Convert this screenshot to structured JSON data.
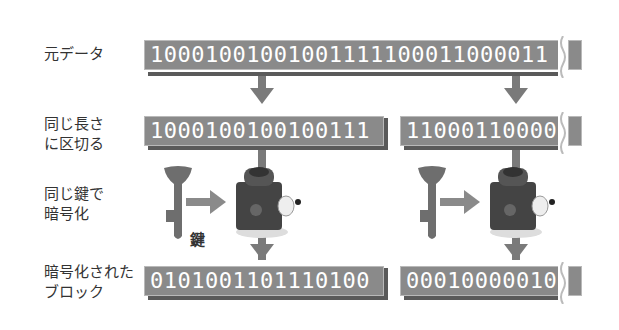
{
  "labels": {
    "original": "元データ",
    "split": "同じ長さ\nに区切る",
    "encrypt": "同じ鍵で\n暗号化",
    "encrypted": "暗号化された\nブロック",
    "key": "鍵"
  },
  "data": {
    "original_bits": "10001001001001111100011000011",
    "block1_bits": "1000100100100111",
    "block2_bits": "11000110000",
    "enc_block1_bits": "0101001101110100",
    "enc_block2_bits": "00010000010"
  },
  "icons": {
    "key": "key-icon",
    "lock": "lock-machine-icon"
  },
  "colors": {
    "box_fill": "#8a8a8a",
    "box_shadow": "#5a5a5a",
    "arrow": "#7a7a7a",
    "text_light": "#ffffff",
    "label_text": "#333333"
  }
}
